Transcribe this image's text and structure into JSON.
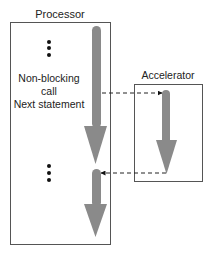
{
  "processor": {
    "title": "Processor",
    "labels": {
      "call_line1": "Non-blocking",
      "call_line2": "call",
      "next": "Next statement"
    }
  },
  "accelerator": {
    "title": "Accelerator"
  },
  "colors": {
    "box_border": "#555555",
    "arrow_fill": "#8a8a8a",
    "dashed_line": "#222222",
    "dots": "#111111"
  }
}
